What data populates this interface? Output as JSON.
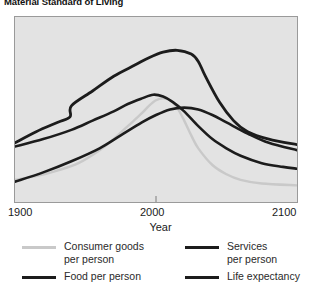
{
  "chart_data": {
    "type": "line",
    "title": "Material Standard of Living",
    "xlabel": "Year",
    "ylabel": "",
    "xlim": [
      1900,
      2100
    ],
    "ylim": [
      0,
      100
    ],
    "xticks": [
      1900,
      2000,
      2100
    ],
    "xtick_labels": [
      "1900",
      "2000",
      "2100"
    ],
    "yticks": [],
    "ytick_labels": [],
    "grid": false,
    "legend_position": "bottom",
    "plot_background": "#e3e3e3",
    "series": [
      {
        "name": "Consumer goods per person",
        "color": "#c9c9c9",
        "width": 2.4,
        "x": [
          1900,
          1915,
          1930,
          1945,
          1960,
          1970,
          1980,
          1990,
          1995,
          2000,
          2005,
          2010,
          2015,
          2020,
          2025,
          2030,
          2040,
          2050,
          2060,
          2075,
          2100
        ],
        "y": [
          12,
          14,
          17,
          21,
          28,
          34,
          41,
          48,
          52,
          55,
          56,
          55,
          51,
          44,
          36,
          29,
          20,
          15,
          12,
          10,
          9
        ]
      },
      {
        "name": "Food per person",
        "color": "#1c1c1c",
        "width": 2.6,
        "x": [
          1900,
          1920,
          1940,
          1955,
          1970,
          1980,
          1990,
          1998,
          2005,
          2012,
          2020,
          2030,
          2040,
          2050,
          2060,
          2075,
          2090,
          2100
        ],
        "y": [
          30,
          34,
          39,
          44,
          49,
          53,
          56,
          58,
          57,
          54,
          49,
          41,
          34,
          29,
          25,
          21,
          19,
          18
        ]
      },
      {
        "name": "Services per person",
        "color": "#1c1c1c",
        "width": 2.8,
        "x": [
          1900,
          1915,
          1930,
          1939,
          1940,
          1955,
          1970,
          1985,
          1995,
          2005,
          2015,
          2025,
          2030,
          2035,
          2045,
          2055,
          2065,
          2080,
          2100
        ],
        "y": [
          32,
          38,
          43,
          46,
          52,
          60,
          68,
          74,
          78,
          81,
          82,
          80,
          76,
          68,
          54,
          44,
          38,
          34,
          31
        ]
      },
      {
        "name": "Life expectancy",
        "color": "#1c1c1c",
        "width": 2.6,
        "x": [
          1900,
          1920,
          1940,
          1960,
          1975,
          1990,
          2000,
          2010,
          2020,
          2030,
          2040,
          2050,
          2065,
          2080,
          2100
        ],
        "y": [
          11,
          16,
          22,
          29,
          36,
          43,
          47,
          50,
          51,
          50,
          47,
          43,
          37,
          32,
          28
        ]
      }
    ],
    "legend_entries": [
      {
        "label": "Consumer goods\nper person",
        "color": "#c9c9c9"
      },
      {
        "label": "Services\nper person",
        "color": "#1c1c1c"
      },
      {
        "label": "Food per person",
        "color": "#1c1c1c"
      },
      {
        "label": "Life expectancy",
        "color": "#1c1c1c"
      }
    ]
  }
}
